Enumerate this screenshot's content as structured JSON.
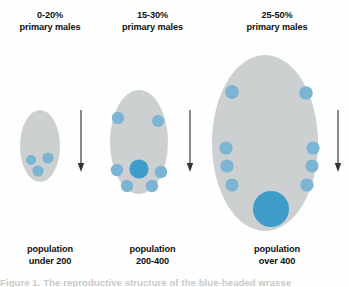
{
  "figure": {
    "title_present": false,
    "background_color": "#fefefe",
    "ellipse_fill": "#ccd0d0",
    "dot_light_color": "#7cb4d4",
    "dot_strong_color": "#3d9dc8",
    "arrow_color": "#333333",
    "text_color": "#111111"
  },
  "panels": [
    {
      "id": "small",
      "header_line1": "0-20%",
      "header_line2": "primary males",
      "caption_line1": "population",
      "caption_line2": "under 200",
      "ellipse": {
        "cx": 40,
        "cy": 146,
        "rx": 20,
        "ry": 36
      },
      "dots": [
        {
          "cx": 31,
          "cy": 160,
          "r": 5.0,
          "tone": "light"
        },
        {
          "cx": 48,
          "cy": 158,
          "r": 5.6,
          "tone": "light"
        },
        {
          "cx": 38,
          "cy": 171,
          "r": 5.6,
          "tone": "light"
        }
      ],
      "arrow": {
        "x": 81,
        "y_top": 110,
        "y_bottom": 172
      }
    },
    {
      "id": "medium",
      "header_line1": "15-30%",
      "header_line2": "primary males",
      "caption_line1": "population",
      "caption_line2": "200-400",
      "ellipse": {
        "cx": 139,
        "cy": 142,
        "rx": 29,
        "ry": 52
      },
      "dots": [
        {
          "cx": 118,
          "cy": 118,
          "r": 6.2,
          "tone": "light"
        },
        {
          "cx": 158,
          "cy": 121,
          "r": 6.0,
          "tone": "light"
        },
        {
          "cx": 139,
          "cy": 169,
          "r": 9.6,
          "tone": "strong"
        },
        {
          "cx": 117,
          "cy": 170,
          "r": 6.2,
          "tone": "light"
        },
        {
          "cx": 161,
          "cy": 172,
          "r": 6.2,
          "tone": "light"
        },
        {
          "cx": 127,
          "cy": 186,
          "r": 6.2,
          "tone": "light"
        },
        {
          "cx": 152,
          "cy": 186,
          "r": 6.2,
          "tone": "light"
        }
      ],
      "arrow": {
        "x": 190,
        "y_top": 110,
        "y_bottom": 172
      }
    },
    {
      "id": "large",
      "header_line1": "25-50%",
      "header_line2": "primary males",
      "caption_line1": "population",
      "caption_line2": "over 400",
      "ellipse": {
        "cx": 265,
        "cy": 143,
        "rx": 53,
        "ry": 88
      },
      "dots": [
        {
          "cx": 232,
          "cy": 92,
          "r": 7.0,
          "tone": "light"
        },
        {
          "cx": 306,
          "cy": 93,
          "r": 6.8,
          "tone": "light"
        },
        {
          "cx": 226,
          "cy": 148,
          "r": 6.6,
          "tone": "light"
        },
        {
          "cx": 227,
          "cy": 166,
          "r": 6.6,
          "tone": "light"
        },
        {
          "cx": 232,
          "cy": 185,
          "r": 6.6,
          "tone": "light"
        },
        {
          "cx": 313,
          "cy": 148,
          "r": 6.6,
          "tone": "light"
        },
        {
          "cx": 312,
          "cy": 166,
          "r": 6.6,
          "tone": "light"
        },
        {
          "cx": 307,
          "cy": 185,
          "r": 6.6,
          "tone": "light"
        },
        {
          "cx": 271,
          "cy": 209,
          "r": 18.0,
          "tone": "strong"
        }
      ],
      "arrow": {
        "x": 338,
        "y_top": 110,
        "y_bottom": 172
      }
    }
  ],
  "footer": {
    "clipped_text": "Figure 1. The reproductive structure of the blue-headed wrasse"
  }
}
